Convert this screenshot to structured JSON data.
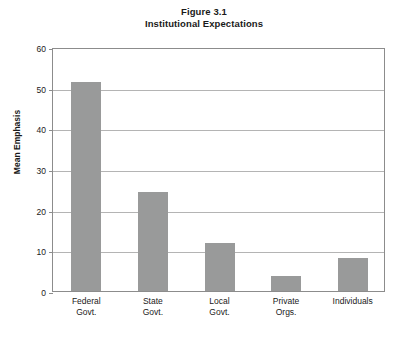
{
  "chart_data": {
    "type": "bar",
    "title": "Figure 3.1",
    "subtitle": "Institutional Expectations",
    "xlabel": "",
    "ylabel": "Mean Emphasis",
    "categories": [
      "Federal Govt.",
      "State Govt.",
      "Local Govt.",
      "Private Orgs.",
      "Individuals"
    ],
    "category_lines": [
      {
        "line1": "Federal",
        "line2": "Govt."
      },
      {
        "line1": "State",
        "line2": "Govt."
      },
      {
        "line1": "Local",
        "line2": "Govt."
      },
      {
        "line1": "Private",
        "line2": "Orgs."
      },
      {
        "line1": "Individuals",
        "line2": ""
      }
    ],
    "values": [
      51.5,
      24.3,
      11.7,
      3.6,
      8.0
    ],
    "ylim": [
      0,
      60
    ],
    "yticks": [
      0,
      10,
      20,
      30,
      40,
      50,
      60
    ],
    "ytick_labels": [
      "0",
      "10",
      "20",
      "30",
      "40",
      "50",
      "60"
    ],
    "grid": "horizontal",
    "legend": "none",
    "bar_color": "#999a9a",
    "gridline_color": "#b4b4b4",
    "frame_color": "#8c8c8c",
    "background_color": "#ffffff"
  }
}
